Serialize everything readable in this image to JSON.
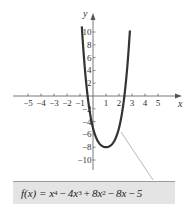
{
  "chart_data": {
    "type": "line",
    "title": "",
    "function_label": "f(x) = x^4 − 4x^3 + 8x^2 − 8x − 5",
    "xlabel": "x",
    "ylabel": "y",
    "xlim": [
      -5.5,
      6.5
    ],
    "ylim": [
      -12,
      12
    ],
    "x_ticks": [
      -5,
      -4,
      -3,
      -2,
      -1,
      1,
      2,
      3,
      4,
      5
    ],
    "x_tick_labels": [
      "−5",
      "−4",
      "−3",
      "−2",
      "−1",
      "1",
      "2",
      "3",
      "4",
      "5"
    ],
    "y_ticks": [
      10,
      8,
      6,
      4,
      2,
      -2,
      -4,
      -6,
      -8,
      -10
    ],
    "y_tick_labels": [
      "10",
      "8",
      "6",
      "4",
      "2",
      "−2",
      "−4",
      "−6",
      "−8",
      "−10"
    ],
    "grid": false,
    "series": [
      {
        "name": "f(x)",
        "x": [
          -1,
          -0.75,
          -0.5,
          -0.25,
          0,
          0.25,
          0.5,
          0.75,
          1,
          1.25,
          1.5,
          1.75,
          2,
          2.25,
          2.5,
          2.75
        ],
        "values": [
          16,
          7.6,
          1.8,
          -2.3,
          -5,
          -6.6,
          -7.4,
          -7.8,
          -8,
          -7.7,
          -6.8,
          -4.9,
          -1,
          3.7,
          11.6,
          22.4
        ]
      }
    ],
    "annotations": [
      {
        "type": "leader-line",
        "from_point": [
          2.1,
          -5.5
        ],
        "to": "formula-label"
      }
    ]
  },
  "labels": {
    "x_axis": "x",
    "y_axis": "y",
    "formula_parts": {
      "lhs": "f(x) = x",
      "e4": "4",
      "t2": "4x",
      "e3": "3",
      "t3": "8x",
      "e2": "2",
      "t4": "8x",
      "t5": "5",
      "minus": "−",
      "plus": "+"
    }
  }
}
